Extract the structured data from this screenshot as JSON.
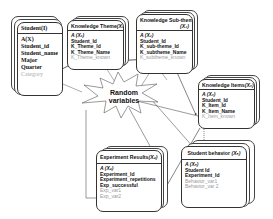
{
  "diagram": {
    "center_label": {
      "line1": "Random",
      "line2": "variables"
    },
    "entities": {
      "student": {
        "title": "Student",
        "title_suffix": "(I)",
        "fields": [
          "A(X)",
          "Student_id",
          "Student_name",
          "Major",
          "Quarter"
        ],
        "random_fields": [
          "Category"
        ]
      },
      "knowledge_theme": {
        "title": "Knowledge Theme",
        "title_suffix": "(X₁)",
        "fields": [
          "A (X₁)",
          "Student_Id",
          "K_Theme_Id",
          "K_Theme_Name"
        ],
        "random_fields": [
          "K_Theme_known"
        ]
      },
      "knowledge_subtheme": {
        "title": "Knowledge Sub-theme",
        "title_suffix": "(X₂)",
        "fields": [
          "A (X₂)",
          "Student_Id",
          "K_sub-theme_Id",
          "K_subtheme_Name"
        ],
        "random_fields": [
          "K_subtheme_known"
        ]
      },
      "knowledge_item": {
        "title": "Knowledge Items",
        "title_suffix": "(X₃)",
        "fields": [
          "A (X₃)",
          "Student_Id",
          "K_Item_Id",
          "K_Item_Name"
        ],
        "random_fields": [
          "K_Item_known"
        ]
      },
      "experiment_results": {
        "title": "Experiment Results",
        "title_suffix": "(X₄)",
        "fields": [
          "A (X₄)",
          "Experiment_Id",
          "Experiment_repetitions",
          "Exp_successful"
        ],
        "random_fields": [
          "Exp_var1",
          "Exp_var2"
        ]
      },
      "student_behavior": {
        "title": "Student behavior",
        "title_suffix": "(X₅)",
        "fields": [
          "A (X₅)",
          "Student Id",
          "Experiment_Id"
        ],
        "random_fields": [
          "Behavior_var1",
          "Behavior_var 2"
        ]
      }
    },
    "colors": {
      "line": "#333333",
      "random_field": "#999999",
      "border": "#333333"
    }
  }
}
